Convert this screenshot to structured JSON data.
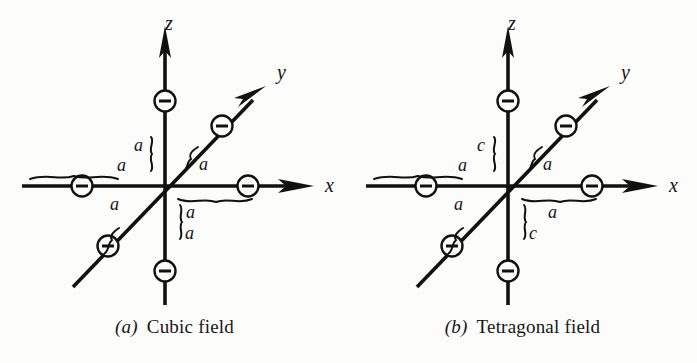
{
  "figure": {
    "type": "crystal-field-ligand-diagram",
    "background_color": "#fcfcfa",
    "ink_color": "#111111",
    "panel_count": 2
  },
  "panels": [
    {
      "id": "a",
      "caption_letter": "(a)",
      "caption_text": "Cubic field",
      "axes": [
        {
          "name": "z",
          "label": "z",
          "direction": "up"
        },
        {
          "name": "x",
          "label": "x",
          "direction": "right"
        },
        {
          "name": "y",
          "label": "y",
          "direction": "up-right-diagonal"
        }
      ],
      "charges": [
        {
          "name": "ion-z-positive",
          "sign": "−",
          "axis": "z",
          "side": "positive"
        },
        {
          "name": "ion-z-negative",
          "sign": "−",
          "axis": "z",
          "side": "negative"
        },
        {
          "name": "ion-x-positive",
          "sign": "−",
          "axis": "x",
          "side": "positive"
        },
        {
          "name": "ion-x-negative",
          "sign": "−",
          "axis": "x",
          "side": "negative"
        },
        {
          "name": "ion-y-positive",
          "sign": "−",
          "axis": "y",
          "side": "positive"
        },
        {
          "name": "ion-y-negative",
          "sign": "−",
          "axis": "y",
          "side": "negative"
        }
      ],
      "distances": [
        {
          "name": "dist-z-up-outer",
          "label": "a"
        },
        {
          "name": "dist-x-left",
          "label": "a"
        },
        {
          "name": "dist-y-up",
          "label": "a"
        },
        {
          "name": "dist-y-down",
          "label": "a"
        },
        {
          "name": "dist-x-right",
          "label": "a"
        },
        {
          "name": "dist-z-down",
          "label": "a"
        }
      ]
    },
    {
      "id": "b",
      "caption_letter": "(b)",
      "caption_text": "Tetragonal field",
      "axes": [
        {
          "name": "z",
          "label": "z",
          "direction": "up"
        },
        {
          "name": "x",
          "label": "x",
          "direction": "right"
        },
        {
          "name": "y",
          "label": "y",
          "direction": "up-right-diagonal"
        }
      ],
      "charges": [
        {
          "name": "ion-z-positive",
          "sign": "−",
          "axis": "z",
          "side": "positive"
        },
        {
          "name": "ion-z-negative",
          "sign": "−",
          "axis": "z",
          "side": "negative"
        },
        {
          "name": "ion-x-positive",
          "sign": "−",
          "axis": "x",
          "side": "positive"
        },
        {
          "name": "ion-x-negative",
          "sign": "−",
          "axis": "x",
          "side": "negative"
        },
        {
          "name": "ion-y-positive",
          "sign": "−",
          "axis": "y",
          "side": "positive"
        },
        {
          "name": "ion-y-negative",
          "sign": "−",
          "axis": "y",
          "side": "negative"
        }
      ],
      "distances": [
        {
          "name": "dist-z-up-outer",
          "label": "c"
        },
        {
          "name": "dist-x-left",
          "label": "a"
        },
        {
          "name": "dist-y-up",
          "label": "a"
        },
        {
          "name": "dist-y-down",
          "label": "a"
        },
        {
          "name": "dist-x-right",
          "label": "a"
        },
        {
          "name": "dist-z-down",
          "label": "c"
        }
      ]
    }
  ]
}
